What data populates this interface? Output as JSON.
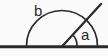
{
  "figure": {
    "kind": "geometry-angle-diagram",
    "width": 108,
    "height": 56,
    "background_color": "#fbfbfb",
    "stroke_color": "#2b2b2b",
    "label_color": "#262626"
  },
  "labels": {
    "outer_angle": "b",
    "inner_angle": "a"
  },
  "elements": {
    "baseline_name": "baseline",
    "ray_name": "angle-ray",
    "large_arc_name": "large-angle-arc",
    "small_arc_name": "small-angle-arc",
    "vertex_name": "angle-vertex"
  },
  "geometry": {
    "vertex": [
      62,
      46
    ],
    "baseline_start": [
      0,
      46
    ],
    "baseline_end": [
      108,
      46
    ],
    "ray_end": [
      101,
      4
    ],
    "large_arc_radius": 36,
    "large_arc_start": [
      26,
      46
    ],
    "large_arc_end": [
      98,
      46
    ],
    "small_arc_radius": 15,
    "small_arc_start": [
      73,
      35
    ],
    "small_arc_end": [
      77,
      46
    ]
  }
}
